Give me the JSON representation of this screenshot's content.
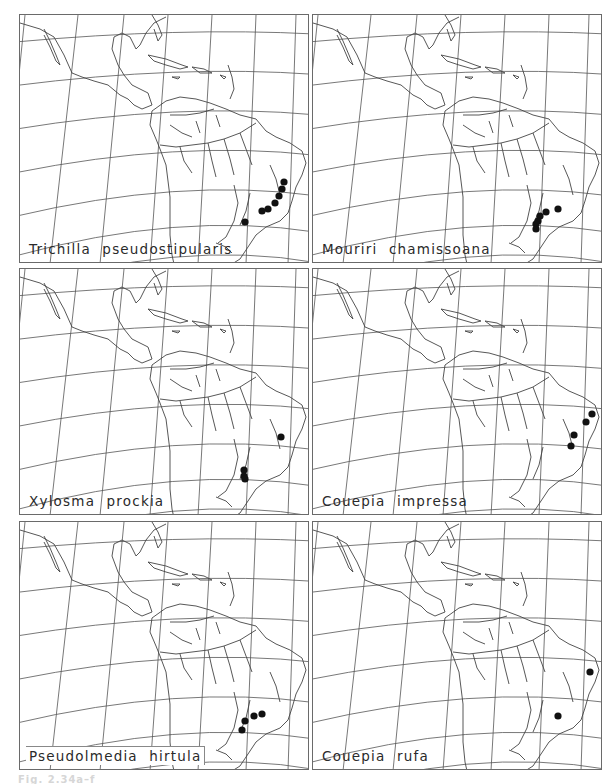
{
  "figure": {
    "layout": {
      "rows": 3,
      "cols": 2
    },
    "caption": "Fig. 2.34a–f",
    "dot_color": "#111111",
    "line_color": "#555555",
    "panels": [
      {
        "id": "a",
        "species": "Trichilla  pseudostipularis",
        "boxed_label": false,
        "rect": {
          "x": 19,
          "y": 14,
          "w": 290,
          "h": 249
        },
        "dots": [
          [
            283,
            181
          ],
          [
            281,
            188
          ],
          [
            278,
            195
          ],
          [
            274,
            202
          ],
          [
            267,
            208
          ],
          [
            261,
            210
          ],
          [
            244,
            221
          ]
        ]
      },
      {
        "id": "b",
        "species": "Mouriri  chamissoana",
        "boxed_label": false,
        "rect": {
          "x": 312,
          "y": 14,
          "w": 290,
          "h": 249
        },
        "dots": [
          [
            557,
            208
          ],
          [
            545,
            211
          ],
          [
            539,
            215
          ],
          [
            537,
            220
          ],
          [
            535,
            223
          ],
          [
            535,
            228
          ]
        ]
      },
      {
        "id": "c",
        "species": "Xylosma  prockia",
        "boxed_label": false,
        "rect": {
          "x": 19,
          "y": 268,
          "w": 290,
          "h": 247
        },
        "dots": [
          [
            280,
            436
          ],
          [
            243,
            469
          ],
          [
            243,
            475
          ],
          [
            244,
            478
          ]
        ]
      },
      {
        "id": "d",
        "species": "Couepia  impressa",
        "boxed_label": false,
        "rect": {
          "x": 312,
          "y": 268,
          "w": 290,
          "h": 247
        },
        "dots": [
          [
            591,
            413
          ],
          [
            585,
            421
          ],
          [
            573,
            434
          ],
          [
            570,
            445
          ]
        ]
      },
      {
        "id": "e",
        "species": "Pseudolmedia  hirtula",
        "boxed_label": true,
        "rect": {
          "x": 19,
          "y": 521,
          "w": 290,
          "h": 249
        },
        "dots": [
          [
            261,
            713
          ],
          [
            253,
            715
          ],
          [
            244,
            720
          ],
          [
            241,
            729
          ]
        ]
      },
      {
        "id": "f",
        "species": "Couepia  rufa",
        "boxed_label": false,
        "rect": {
          "x": 312,
          "y": 521,
          "w": 290,
          "h": 249
        },
        "dots": [
          [
            589,
            671
          ],
          [
            557,
            715
          ]
        ]
      }
    ]
  }
}
